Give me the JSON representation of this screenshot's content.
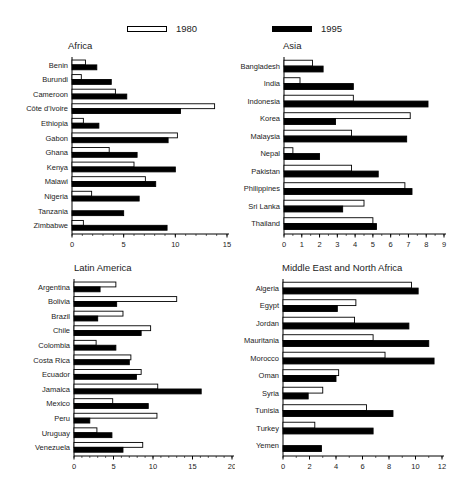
{
  "legend": {
    "items": [
      {
        "label": "1980",
        "fill": "#ffffff"
      },
      {
        "label": "1995",
        "fill": "#000000"
      }
    ]
  },
  "colors": {
    "bar_outline": "#000000",
    "bar_1980": "#ffffff",
    "bar_1995": "#000000",
    "text": "#1c1c1c",
    "background": "#ffffff"
  },
  "chart_data": [
    {
      "type": "bar",
      "orientation": "horizontal",
      "title": "Africa",
      "categories": [
        "Benin",
        "Burundi",
        "Cameroon",
        "Côte d'Ivoire",
        "Ethiopia",
        "Gabon",
        "Ghana",
        "Kenya",
        "Malawi",
        "Nigeria",
        "Tanzania",
        "Zimbabwe"
      ],
      "series": [
        {
          "name": "1980",
          "values": [
            1.3,
            0.9,
            4.2,
            13.8,
            1.1,
            10.2,
            3.6,
            6.0,
            7.1,
            1.9,
            0,
            1.1
          ]
        },
        {
          "name": "1995",
          "values": [
            2.4,
            3.8,
            5.3,
            10.5,
            2.6,
            9.3,
            6.3,
            10.0,
            8.1,
            6.5,
            5.0,
            9.2
          ]
        }
      ],
      "xlim": [
        0,
        15
      ],
      "xticks": [
        0,
        5,
        10,
        15
      ],
      "minor_tick_step": 1,
      "grid": false,
      "legend_position": "top"
    },
    {
      "type": "bar",
      "orientation": "horizontal",
      "title": "Asia",
      "categories": [
        "Bangladesh",
        "India",
        "Indonesia",
        "Korea",
        "Malaysia",
        "Nepal",
        "Pakistan",
        "Philippines",
        "Sri Lanka",
        "Thailand"
      ],
      "series": [
        {
          "name": "1980",
          "values": [
            1.6,
            0.9,
            3.9,
            7.1,
            3.8,
            0.5,
            3.8,
            6.8,
            4.5,
            5.0
          ]
        },
        {
          "name": "1995",
          "values": [
            2.2,
            3.9,
            8.1,
            2.9,
            6.9,
            2.0,
            5.3,
            7.2,
            3.3,
            5.2
          ]
        }
      ],
      "xlim": [
        0,
        9
      ],
      "xticks": [
        0,
        1,
        2,
        3,
        4,
        5,
        6,
        7,
        8,
        9
      ],
      "minor_tick_step": 0.5,
      "grid": false,
      "legend_position": "top"
    },
    {
      "type": "bar",
      "orientation": "horizontal",
      "title": "Latin America",
      "categories": [
        "Argentina",
        "Bolivia",
        "Brazil",
        "Chile",
        "Colombia",
        "Costa Rica",
        "Ecuador",
        "Jamaica",
        "Mexico",
        "Peru",
        "Uruguay",
        "Venezuela"
      ],
      "series": [
        {
          "name": "1980",
          "values": [
            5.3,
            13.0,
            6.2,
            9.7,
            2.8,
            7.2,
            8.5,
            10.6,
            4.9,
            10.5,
            2.9,
            8.7
          ]
        },
        {
          "name": "1995",
          "values": [
            3.3,
            5.4,
            3.0,
            8.5,
            5.3,
            7.0,
            7.9,
            16.1,
            9.4,
            2.0,
            4.8,
            6.2
          ]
        }
      ],
      "xlim": [
        0,
        20
      ],
      "xticks": [
        0,
        5,
        10,
        15,
        20
      ],
      "minor_tick_step": 1,
      "grid": false,
      "legend_position": "top"
    },
    {
      "type": "bar",
      "orientation": "horizontal",
      "title": "Middle East and North Africa",
      "categories": [
        "Algeria",
        "Egypt",
        "Jordan",
        "Mauritania",
        "Morocco",
        "Oman",
        "Syria",
        "Tunisia",
        "Turkey",
        "Yemen"
      ],
      "series": [
        {
          "name": "1980",
          "values": [
            9.7,
            5.5,
            5.4,
            6.8,
            7.7,
            4.2,
            3.0,
            6.3,
            2.4,
            0
          ]
        },
        {
          "name": "1995",
          "values": [
            10.2,
            4.1,
            9.5,
            11.0,
            11.4,
            4.0,
            1.9,
            8.3,
            6.8,
            2.9
          ]
        }
      ],
      "xlim": [
        0,
        12
      ],
      "xticks": [
        0,
        2,
        4,
        6,
        8,
        10,
        12
      ],
      "minor_tick_step": 1,
      "grid": false,
      "legend_position": "top"
    }
  ]
}
